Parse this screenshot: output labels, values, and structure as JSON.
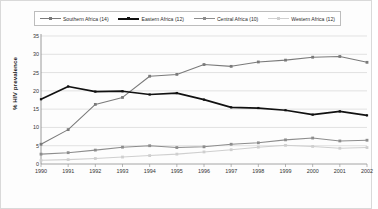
{
  "chart_data": {
    "type": "line",
    "title": "",
    "xlabel": "",
    "ylabel": "% HIV prevalence",
    "categories": [
      "1990",
      "1991",
      "1992",
      "1993",
      "1994",
      "1995",
      "1996",
      "1997",
      "1998",
      "1999",
      "2000",
      "2001",
      "2002"
    ],
    "x": [
      1990,
      1991,
      1992,
      1993,
      1994,
      1995,
      1996,
      1997,
      1998,
      1999,
      2000,
      2001,
      2002
    ],
    "ylim": [
      0,
      35
    ],
    "yticks": [
      0,
      5,
      10,
      15,
      20,
      25,
      30,
      35
    ],
    "grid": true,
    "legend_position": "top",
    "series": [
      {
        "name": "Southern Africa (14)",
        "color": "#7a7a7a",
        "marker": "square",
        "values": [
          5.4,
          9.4,
          16.3,
          18.2,
          24.0,
          24.5,
          27.2,
          26.7,
          27.9,
          28.4,
          29.2,
          29.4,
          27.8
        ]
      },
      {
        "name": "Eastern Africa (12)",
        "color": "#111111",
        "marker": "square",
        "values": [
          17.7,
          21.2,
          19.8,
          19.9,
          19.0,
          19.4,
          17.6,
          15.5,
          15.3,
          14.7,
          13.5,
          14.4,
          13.3
        ]
      },
      {
        "name": "Central Africa (10)",
        "color": "#8d8d8d",
        "marker": "square",
        "values": [
          2.7,
          3.1,
          3.8,
          4.6,
          5.0,
          4.5,
          4.7,
          5.4,
          5.8,
          6.6,
          7.1,
          6.3,
          6.5
        ]
      },
      {
        "name": "Western Africa (12)",
        "color": "#cfcfcf",
        "marker": "square",
        "values": [
          1.0,
          1.2,
          1.5,
          1.9,
          2.3,
          2.7,
          3.3,
          3.9,
          4.6,
          5.1,
          4.8,
          4.3,
          4.5
        ]
      }
    ]
  },
  "legend": {
    "items": [
      {
        "label": "Southern Africa (14)"
      },
      {
        "label": "Eastern Africa (12)"
      },
      {
        "label": "Central Africa (10)"
      },
      {
        "label": "Western Africa (12)"
      }
    ]
  },
  "caption": {
    "text": ""
  }
}
